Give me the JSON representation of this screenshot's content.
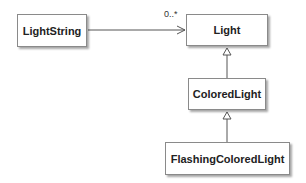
{
  "diagram": {
    "type": "uml-class-diagram",
    "classes": [
      {
        "id": "lightstring",
        "name": "LightString"
      },
      {
        "id": "light",
        "name": "Light"
      },
      {
        "id": "colored",
        "name": "ColoredLight"
      },
      {
        "id": "flashing",
        "name": "FlashingColoredLight"
      }
    ],
    "relationships": [
      {
        "type": "association",
        "from": "LightString",
        "to": "Light",
        "multiplicity": "0..*",
        "navigable_end": "Light"
      },
      {
        "type": "generalization",
        "from": "ColoredLight",
        "to": "Light"
      },
      {
        "type": "generalization",
        "from": "FlashingColoredLight",
        "to": "ColoredLight"
      }
    ],
    "colors": {
      "line": "#555555",
      "box_border": "#8a8a8a",
      "text": "#222222"
    }
  }
}
